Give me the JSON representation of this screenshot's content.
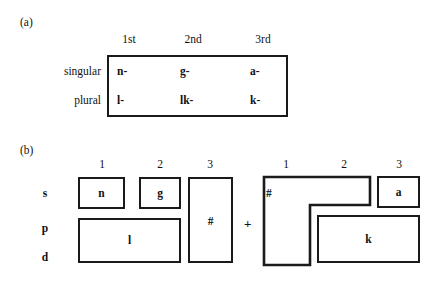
{
  "figure": {
    "panel_a": {
      "label": "(a)",
      "column_headers": [
        "1st",
        "2nd",
        "3rd"
      ],
      "row_labels": [
        "singular",
        "plural"
      ],
      "rows": [
        {
          "label": "singular",
          "cells": [
            "n-",
            "g-",
            "a-"
          ]
        },
        {
          "label": "plural",
          "cells": [
            "l-",
            "lk-",
            "k-"
          ]
        }
      ],
      "border_color": "#1a1a1a"
    },
    "panel_b": {
      "label": "(b)",
      "left_column_headers": [
        "1",
        "2",
        "3"
      ],
      "right_column_headers": [
        "1",
        "2",
        "3"
      ],
      "row_labels": [
        "s",
        "p",
        "d"
      ],
      "operator": "+",
      "left_boxes": [
        {
          "name": "n-box",
          "text": "n"
        },
        {
          "name": "g-box",
          "text": "g"
        },
        {
          "name": "l-box",
          "text": "l"
        },
        {
          "name": "hash-tall-box",
          "text": "#"
        }
      ],
      "right_boxes": [
        {
          "name": "hash-lshape-box",
          "text": "#"
        },
        {
          "name": "a-box",
          "text": "a"
        },
        {
          "name": "k-box",
          "text": "k"
        }
      ],
      "border_color": "#1a1a1a"
    }
  }
}
